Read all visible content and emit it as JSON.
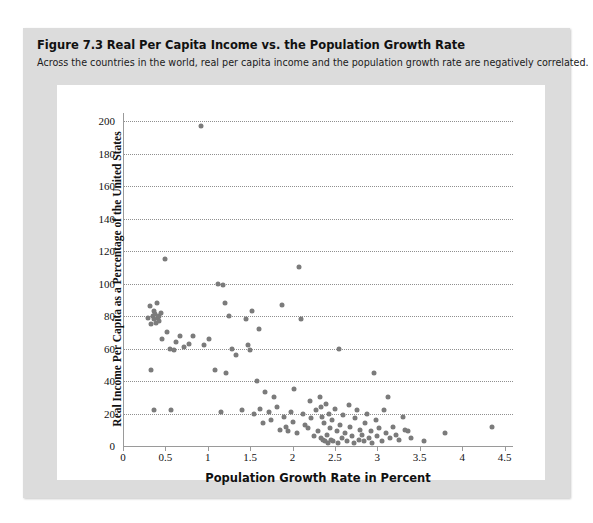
{
  "figure": {
    "label": "Figure 7.3",
    "title": "Real Per Capita Income vs. the Population Growth Rate",
    "subtitle": "Across the countries in the world, real per capita income and the population growth rate are negatively correlated."
  },
  "colors": {
    "panel_background": "#dcdcdc",
    "plot_background": "#ffffff",
    "point": "#7b7b7b",
    "gridline": "#8f8f8f",
    "axis": "#9a9a9a"
  },
  "chart_data": {
    "type": "scatter",
    "title": "Real Per Capita Income vs. the Population Growth Rate",
    "xlabel": "Population Growth Rate in Percent",
    "ylabel": "Real Income Per Capita as a Percentage of the United States",
    "xlim": [
      0,
      4.6
    ],
    "ylim": [
      0,
      205
    ],
    "xticks": [
      0,
      0.5,
      1,
      1.5,
      2,
      2.5,
      3,
      3.5,
      4,
      4.5
    ],
    "xtick_labels": [
      "0",
      "0.5",
      "1",
      "1.5",
      "2",
      "2.5",
      "3",
      "3.5",
      "4",
      "4.5"
    ],
    "yticks": [
      0,
      20,
      40,
      60,
      80,
      100,
      120,
      140,
      160,
      180,
      200
    ],
    "ytick_labels": [
      "0",
      "20",
      "40",
      "60",
      "80",
      "100",
      "120",
      "140",
      "160",
      "180",
      "200"
    ],
    "grid": "horizontal-dotted",
    "legend": "none",
    "series": [
      {
        "name": "Countries",
        "points": [
          [
            0.3,
            79
          ],
          [
            0.32,
            86
          ],
          [
            0.33,
            75
          ],
          [
            0.35,
            80
          ],
          [
            0.36,
            83
          ],
          [
            0.37,
            78
          ],
          [
            0.38,
            81
          ],
          [
            0.39,
            76
          ],
          [
            0.4,
            88
          ],
          [
            0.41,
            79
          ],
          [
            0.42,
            80
          ],
          [
            0.43,
            77
          ],
          [
            0.45,
            82
          ],
          [
            0.46,
            66
          ],
          [
            0.33,
            47
          ],
          [
            0.36,
            22
          ],
          [
            0.5,
            115
          ],
          [
            0.52,
            70
          ],
          [
            0.55,
            60
          ],
          [
            0.57,
            22
          ],
          [
            0.6,
            59
          ],
          [
            0.62,
            64
          ],
          [
            0.67,
            68
          ],
          [
            0.72,
            61
          ],
          [
            0.78,
            63
          ],
          [
            0.83,
            68
          ],
          [
            0.92,
            197
          ],
          [
            0.95,
            62
          ],
          [
            1.02,
            66
          ],
          [
            1.08,
            47
          ],
          [
            1.12,
            100
          ],
          [
            1.15,
            21
          ],
          [
            1.18,
            99
          ],
          [
            1.2,
            88
          ],
          [
            1.22,
            45
          ],
          [
            1.25,
            80
          ],
          [
            1.28,
            60
          ],
          [
            1.33,
            56
          ],
          [
            1.4,
            22
          ],
          [
            1.45,
            78
          ],
          [
            1.48,
            62
          ],
          [
            1.5,
            59
          ],
          [
            1.52,
            83
          ],
          [
            1.55,
            20
          ],
          [
            1.58,
            40
          ],
          [
            1.6,
            72
          ],
          [
            1.62,
            23
          ],
          [
            1.65,
            14
          ],
          [
            1.68,
            33
          ],
          [
            1.72,
            21
          ],
          [
            1.75,
            16
          ],
          [
            1.78,
            30
          ],
          [
            1.82,
            24
          ],
          [
            1.85,
            10
          ],
          [
            1.88,
            87
          ],
          [
            1.9,
            18
          ],
          [
            1.92,
            12
          ],
          [
            1.95,
            9
          ],
          [
            1.98,
            21
          ],
          [
            2.0,
            15
          ],
          [
            2.02,
            35
          ],
          [
            2.05,
            8
          ],
          [
            2.08,
            110
          ],
          [
            2.1,
            78
          ],
          [
            2.12,
            20
          ],
          [
            2.15,
            13
          ],
          [
            2.18,
            11
          ],
          [
            2.2,
            28
          ],
          [
            2.22,
            17
          ],
          [
            2.25,
            6
          ],
          [
            2.28,
            22
          ],
          [
            2.3,
            9
          ],
          [
            2.32,
            30
          ],
          [
            2.33,
            24
          ],
          [
            2.34,
            5
          ],
          [
            2.35,
            18
          ],
          [
            2.36,
            4
          ],
          [
            2.37,
            14
          ],
          [
            2.38,
            3
          ],
          [
            2.4,
            26
          ],
          [
            2.41,
            7
          ],
          [
            2.42,
            2
          ],
          [
            2.43,
            20
          ],
          [
            2.44,
            11
          ],
          [
            2.45,
            4
          ],
          [
            2.46,
            16
          ],
          [
            2.48,
            3
          ],
          [
            2.5,
            23
          ],
          [
            2.52,
            9
          ],
          [
            2.54,
            2
          ],
          [
            2.55,
            60
          ],
          [
            2.56,
            13
          ],
          [
            2.58,
            5
          ],
          [
            2.6,
            19
          ],
          [
            2.62,
            8
          ],
          [
            2.64,
            3
          ],
          [
            2.66,
            25
          ],
          [
            2.68,
            12
          ],
          [
            2.7,
            6
          ],
          [
            2.72,
            2
          ],
          [
            2.74,
            17
          ],
          [
            2.76,
            22
          ],
          [
            2.78,
            4
          ],
          [
            2.8,
            10
          ],
          [
            2.82,
            7
          ],
          [
            2.84,
            3
          ],
          [
            2.86,
            14
          ],
          [
            2.88,
            20
          ],
          [
            2.9,
            5
          ],
          [
            2.92,
            9
          ],
          [
            2.94,
            2
          ],
          [
            2.96,
            45
          ],
          [
            2.98,
            16
          ],
          [
            3.0,
            6
          ],
          [
            3.02,
            11
          ],
          [
            3.05,
            3
          ],
          [
            3.08,
            22
          ],
          [
            3.1,
            8
          ],
          [
            3.12,
            30
          ],
          [
            3.15,
            5
          ],
          [
            3.18,
            12
          ],
          [
            3.22,
            7
          ],
          [
            3.25,
            4
          ],
          [
            3.3,
            18
          ],
          [
            3.33,
            10
          ],
          [
            3.36,
            9
          ],
          [
            3.4,
            5
          ],
          [
            3.55,
            3
          ],
          [
            3.8,
            8
          ],
          [
            4.35,
            12
          ]
        ]
      }
    ]
  }
}
